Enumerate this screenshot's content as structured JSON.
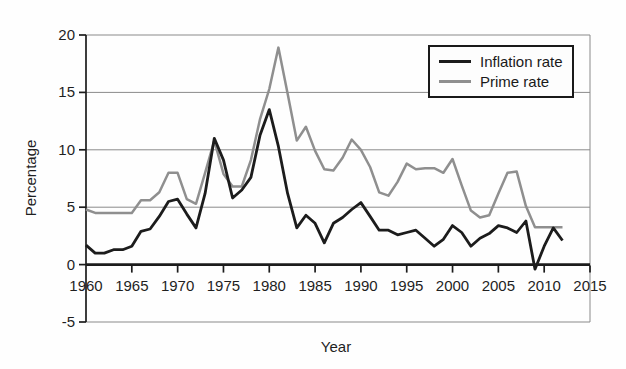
{
  "chart_data": {
    "type": "line",
    "xlabel": "Year",
    "ylabel": "Percentage",
    "xlim": [
      1960,
      2015
    ],
    "ylim": [
      -5,
      20
    ],
    "xticks": [
      1960,
      1965,
      1970,
      1975,
      1980,
      1985,
      1990,
      1995,
      2000,
      2005,
      2010,
      2015
    ],
    "yticks": [
      20,
      15,
      10,
      5,
      0,
      -5
    ],
    "gridlines_y": [
      20,
      15,
      10,
      5,
      -5
    ],
    "grid_on": true,
    "legend_position": "top-right",
    "colors": {
      "grid": "#8a8a8a",
      "axis": "#1c1c1c",
      "text": "#1f1f1f"
    },
    "x": [
      1960,
      1961,
      1962,
      1963,
      1964,
      1965,
      1966,
      1967,
      1968,
      1969,
      1970,
      1971,
      1972,
      1973,
      1974,
      1975,
      1976,
      1977,
      1978,
      1979,
      1980,
      1981,
      1982,
      1983,
      1984,
      1985,
      1986,
      1987,
      1988,
      1989,
      1990,
      1991,
      1992,
      1993,
      1994,
      1995,
      1996,
      1997,
      1998,
      1999,
      2000,
      2001,
      2002,
      2003,
      2004,
      2005,
      2006,
      2007,
      2008,
      2009,
      2010,
      2011,
      2012
    ],
    "series": [
      {
        "name": "Inflation rate",
        "color": "#1c1c1c",
        "values": [
          1.7,
          1.0,
          1.0,
          1.3,
          1.3,
          1.6,
          2.9,
          3.1,
          4.2,
          5.5,
          5.7,
          4.4,
          3.2,
          6.2,
          11.0,
          9.1,
          5.8,
          6.5,
          7.6,
          11.3,
          13.5,
          10.3,
          6.2,
          3.2,
          4.3,
          3.6,
          1.9,
          3.6,
          4.1,
          4.8,
          5.4,
          4.2,
          3.0,
          3.0,
          2.6,
          2.8,
          3.0,
          2.3,
          1.6,
          2.2,
          3.4,
          2.8,
          1.6,
          2.3,
          2.7,
          3.4,
          3.2,
          2.8,
          3.8,
          -0.4,
          1.6,
          3.2,
          2.1
        ]
      },
      {
        "name": "Prime rate",
        "color": "#8f8f8f",
        "values": [
          4.8,
          4.5,
          4.5,
          4.5,
          4.5,
          4.5,
          5.6,
          5.6,
          6.3,
          8.0,
          8.0,
          5.7,
          5.3,
          8.0,
          10.8,
          7.9,
          6.8,
          6.8,
          9.1,
          12.7,
          15.3,
          18.9,
          14.9,
          10.8,
          12.0,
          9.9,
          8.3,
          8.2,
          9.3,
          10.9,
          10.0,
          8.5,
          6.3,
          6.0,
          7.2,
          8.8,
          8.3,
          8.4,
          8.4,
          8.0,
          9.2,
          6.9,
          4.7,
          4.1,
          4.3,
          6.2,
          8.0,
          8.1,
          5.1,
          3.25,
          3.25,
          3.25,
          3.25
        ]
      }
    ]
  }
}
